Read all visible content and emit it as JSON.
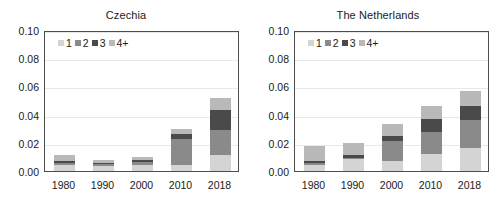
{
  "figure": {
    "background": "#ffffff",
    "width": 504,
    "height": 206
  },
  "series_colors": {
    "1": "#d4d4d4",
    "2": "#8a8a8a",
    "3": "#4a4a4a",
    "4+": "#b9b9b9"
  },
  "legend": {
    "entries": [
      {
        "label": "1",
        "color": "#d4d4d4"
      },
      {
        "label": "2",
        "color": "#8a8a8a"
      },
      {
        "label": "3",
        "color": "#4a4a4a"
      },
      {
        "label": "4+",
        "color": "#b9b9b9"
      }
    ]
  },
  "yticks": [
    "0.00",
    "0.02",
    "0.04",
    "0.06",
    "0.08",
    "0.10"
  ],
  "xticks": [
    "1980",
    "1990",
    "2000",
    "2010",
    "2018"
  ],
  "panels": [
    {
      "title": "Czechia"
    },
    {
      "title": "The Netherlands"
    }
  ],
  "chart_data": [
    {
      "type": "bar",
      "title": "Czechia",
      "stacked": true,
      "xlabel": "",
      "ylabel": "",
      "ylim": [
        0.0,
        0.1
      ],
      "yticks": [
        0.0,
        0.02,
        0.04,
        0.06,
        0.08,
        0.1
      ],
      "grid": true,
      "legend_position": "upper-left",
      "categories": [
        "1980",
        "1990",
        "2000",
        "2010",
        "2018"
      ],
      "series": [
        {
          "name": "1",
          "color": "#d4d4d4",
          "values": [
            0.004,
            0.0035,
            0.0045,
            0.004,
            0.011
          ]
        },
        {
          "name": "2",
          "color": "#8a8a8a",
          "values": [
            0.002,
            0.0015,
            0.002,
            0.0185,
            0.018
          ]
        },
        {
          "name": "3",
          "color": "#4a4a4a",
          "values": [
            0.001,
            0.001,
            0.001,
            0.0035,
            0.014
          ]
        },
        {
          "name": "4+",
          "color": "#b9b9b9",
          "values": [
            0.004,
            0.002,
            0.0025,
            0.004,
            0.009
          ]
        }
      ],
      "totals": [
        0.011,
        0.008,
        0.01,
        0.03,
        0.052
      ]
    },
    {
      "type": "bar",
      "title": "The Netherlands",
      "stacked": true,
      "xlabel": "",
      "ylabel": "",
      "ylim": [
        0.0,
        0.1
      ],
      "yticks": [
        0.0,
        0.02,
        0.04,
        0.06,
        0.08,
        0.1
      ],
      "grid": true,
      "legend_position": "upper-left",
      "categories": [
        "1980",
        "1990",
        "2000",
        "2010",
        "2018"
      ],
      "series": [
        {
          "name": "1",
          "color": "#d4d4d4",
          "values": [
            0.0045,
            0.0085,
            0.007,
            0.012,
            0.016
          ]
        },
        {
          "name": "2",
          "color": "#8a8a8a",
          "values": [
            0.001,
            0.001,
            0.0145,
            0.0155,
            0.0205
          ]
        },
        {
          "name": "3",
          "color": "#4a4a4a",
          "values": [
            0.0015,
            0.0015,
            0.003,
            0.0095,
            0.0095
          ]
        },
        {
          "name": "4+",
          "color": "#b9b9b9",
          "values": [
            0.011,
            0.009,
            0.0085,
            0.009,
            0.011
          ]
        }
      ],
      "totals": [
        0.018,
        0.02,
        0.033,
        0.046,
        0.057
      ]
    }
  ]
}
